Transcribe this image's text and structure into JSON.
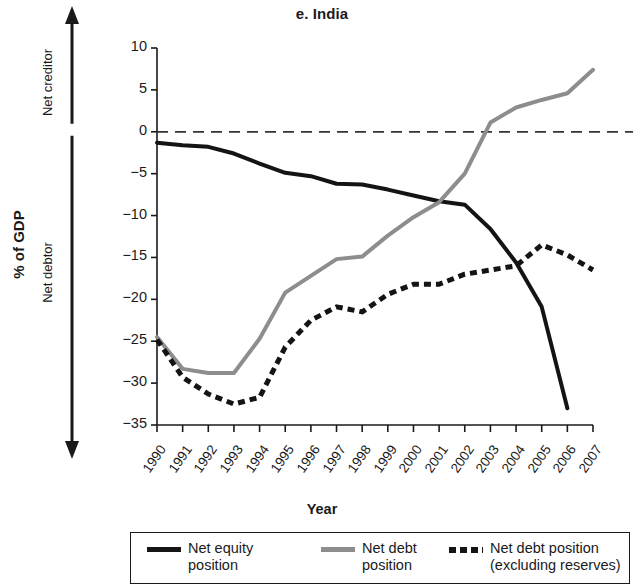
{
  "figure": {
    "title": "e. India",
    "y_axis_title": "% of GDP",
    "x_axis_title": "Year",
    "direction_up": "Net creditor",
    "direction_down": "Net debtor"
  },
  "colors": {
    "net_equity": "#141414",
    "net_debt": "#8d8d8d",
    "net_debt_excl_reserves": "#141414",
    "zero_line": "#333333",
    "axis": "#1a1a1a"
  },
  "legend": {
    "entries": [
      {
        "label": "Net equity\nposition",
        "style": "solid-black"
      },
      {
        "label": "Net debt\nposition",
        "style": "solid-gray"
      },
      {
        "label": "Net debt position\n(excluding reserves)",
        "style": "dashed-black"
      }
    ]
  },
  "chart_data": {
    "type": "line",
    "title": "e. India",
    "xlabel": "Year",
    "ylabel": "% of GDP",
    "x": [
      1990,
      1991,
      1992,
      1993,
      1994,
      1995,
      1996,
      1997,
      1998,
      1999,
      2000,
      2001,
      2002,
      2003,
      2004,
      2005,
      2006,
      2007
    ],
    "categories": [
      "1990",
      "1991",
      "1992",
      "1993",
      "1994",
      "1995",
      "1996",
      "1997",
      "1998",
      "1999",
      "2000",
      "2001",
      "2002",
      "2003",
      "2004",
      "2005",
      "2006",
      "2007"
    ],
    "ylim": [
      -35,
      10
    ],
    "yticks": [
      10,
      5,
      0,
      -5,
      -10,
      -15,
      -20,
      -25,
      -30,
      -35
    ],
    "ytick_labels": [
      "10",
      "5",
      "0",
      "−5",
      "−10",
      "−15",
      "−20",
      "−25",
      "−30",
      "−35"
    ],
    "grid": false,
    "zero_reference_line": 0,
    "legend_position": "bottom",
    "series": [
      {
        "name": "Net equity position",
        "style": "solid",
        "color": "#141414",
        "values": [
          -1.3,
          -1.6,
          -1.8,
          -2.6,
          -3.8,
          -4.9,
          -5.3,
          -6.2,
          -6.3,
          -6.9,
          -7.6,
          -8.3,
          -8.7,
          -11.6,
          -15.6,
          -20.9,
          -33.0,
          null
        ]
      },
      {
        "name": "Net debt position",
        "style": "solid",
        "color": "#8d8d8d",
        "values": [
          -24.5,
          -28.3,
          -28.8,
          -28.8,
          -24.7,
          -19.2,
          -17.2,
          -15.2,
          -14.9,
          -12.4,
          -10.2,
          -8.4,
          -5.0,
          1.1,
          2.9,
          3.8,
          4.6,
          7.4
        ]
      },
      {
        "name": "Net debt position (excluding reserves)",
        "style": "dashed",
        "color": "#141414",
        "values": [
          -24.8,
          -29.3,
          -31.3,
          -32.5,
          -31.7,
          -25.7,
          -22.5,
          -20.9,
          -21.5,
          -19.4,
          -18.2,
          -18.2,
          -17.0,
          -16.5,
          -16.0,
          -13.5,
          -14.7,
          -16.5
        ]
      }
    ]
  }
}
